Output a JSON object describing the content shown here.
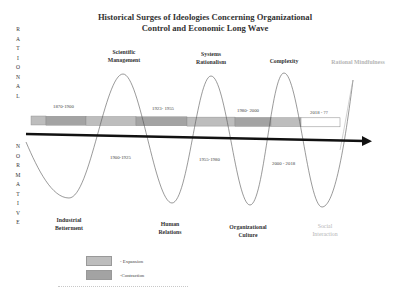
{
  "title": {
    "line1": "Historical Surges of Ideologies Concerning Organizational",
    "line2": "Control and Economic Long Wave"
  },
  "axis_labels": {
    "rational": [
      "R",
      "A",
      "T",
      "I",
      "O",
      "N",
      "A",
      "L"
    ],
    "normative": [
      "N",
      "O",
      "R",
      "M",
      "A",
      "T",
      "I",
      "V",
      "E"
    ]
  },
  "rational_peaks": [
    {
      "line1": "Scientific",
      "line2": "Management"
    },
    {
      "line1": "Systems",
      "line2": "Rationalism"
    },
    {
      "line1": "Complexity",
      "line2": ""
    },
    {
      "line1": "Rational Mindfulness",
      "line2": ""
    }
  ],
  "normative_troughs": [
    {
      "line1": "Industrial",
      "line2": "Betterment"
    },
    {
      "line1": "Human",
      "line2": "Relations"
    },
    {
      "line1": "Organizational",
      "line2": "Culture"
    },
    {
      "line1": "Social",
      "line2": "Interaction"
    }
  ],
  "periods_above": [
    "1870-1900",
    "1923- 1955",
    "1980- 2000",
    "2018 - ??"
  ],
  "periods_below": [
    "1900-1925",
    "1955-1980",
    "2000 - 2018"
  ],
  "timeline_bar": {
    "segments": [
      {
        "type": "expansion",
        "x0": 31,
        "x1": 46
      },
      {
        "type": "contraction",
        "x0": 46,
        "x1": 86
      },
      {
        "type": "expansion",
        "x0": 86,
        "x1": 136
      },
      {
        "type": "contraction",
        "x0": 136,
        "x1": 187
      },
      {
        "type": "expansion",
        "x0": 187,
        "x1": 235
      },
      {
        "type": "contraction",
        "x0": 235,
        "x1": 271
      },
      {
        "type": "expansion",
        "x0": 271,
        "x1": 301
      },
      {
        "type": "future",
        "x0": 301,
        "x1": 340
      }
    ]
  },
  "legend": {
    "expansion": "- Expansion",
    "contraction": "-Contraction"
  },
  "colors": {
    "expansion": "#bdbdbd",
    "contraction": "#a3a3a3",
    "future": "#ffffff",
    "wave": "#555555",
    "wave_future": "#b0b0b0",
    "arrow": "#111111"
  }
}
